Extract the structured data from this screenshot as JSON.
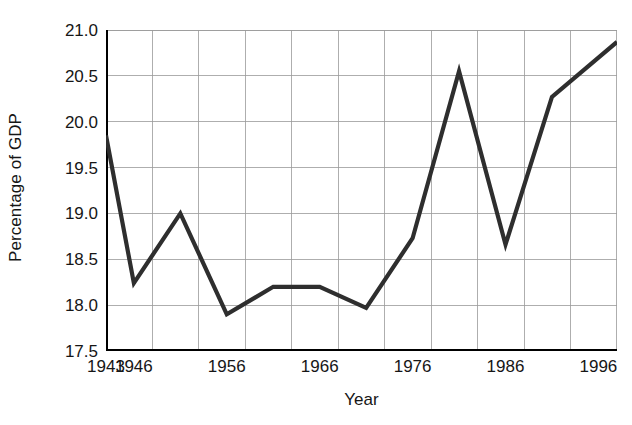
{
  "chart_data": {
    "type": "line",
    "title": "",
    "xlabel": "Year",
    "ylabel": "Percentage of GDP",
    "xlim": [
      1943,
      1998
    ],
    "ylim": [
      17.5,
      21.0
    ],
    "grid": true,
    "legend": "none",
    "line_color": "#2e2e2e",
    "grid_color": "#9a9a9a",
    "axis_color": "#000000",
    "x_tick_labels": [
      "1943",
      "1946",
      "1956",
      "1966",
      "1976",
      "1986",
      "1996"
    ],
    "x_tick_values": [
      1943,
      1946,
      1956,
      1966,
      1976,
      1986,
      1996
    ],
    "y_tick_labels": [
      "17.5",
      "18.0",
      "18.5",
      "19.0",
      "19.5",
      "20.0",
      "20.5",
      "21.0"
    ],
    "y_tick_values": [
      17.5,
      18.0,
      18.5,
      19.0,
      19.5,
      20.0,
      20.5,
      21.0
    ],
    "x": [
      1943,
      1946,
      1951,
      1956,
      1961,
      1966,
      1971,
      1976,
      1981,
      1986,
      1991,
      1998
    ],
    "values": [
      19.85,
      18.24,
      19.0,
      17.9,
      18.2,
      18.2,
      17.97,
      18.73,
      20.55,
      18.66,
      20.27,
      20.87
    ],
    "series": [
      {
        "name": "Percentage of GDP",
        "values": [
          19.85,
          18.24,
          19.0,
          17.9,
          18.2,
          18.2,
          17.97,
          18.73,
          20.55,
          18.66,
          20.27,
          20.87
        ]
      }
    ]
  },
  "axis_titles": {
    "x": "Year",
    "y": "Percentage of GDP"
  }
}
